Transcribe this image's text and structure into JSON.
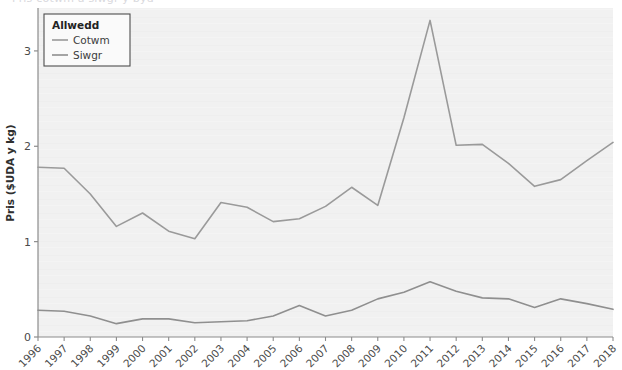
{
  "figure": {
    "width": 622,
    "height": 370,
    "plot_bg": "#f1f1f1",
    "page_bg": "#ffffff",
    "axis_color": "#8c8c8c",
    "cropped_title_text": "Pris cotwm a siwgr y byd"
  },
  "legend": {
    "title": "Allwedd",
    "position": "top-left-inside",
    "border_color": "#4d4d4d",
    "background": "#fafafa",
    "entries": [
      {
        "label": "Cotwm",
        "color": "#9a9a9a"
      },
      {
        "label": "Siwgr",
        "color": "#8f8f8f"
      }
    ]
  },
  "chart_data": {
    "type": "line",
    "title": "",
    "xlabel": "",
    "ylabel": "Pris ($UDA y kg)",
    "xlim": [
      1996,
      2018
    ],
    "ylim": [
      0,
      3.45
    ],
    "yticks": [
      0,
      1,
      2,
      3
    ],
    "ytick_labels": [
      "0",
      "1",
      "2",
      "3"
    ],
    "grid": false,
    "legend_position": "upper left",
    "x": [
      1996,
      1997,
      1998,
      1999,
      2000,
      2001,
      2002,
      2003,
      2004,
      2005,
      2006,
      2007,
      2008,
      2009,
      2010,
      2011,
      2012,
      2013,
      2014,
      2015,
      2016,
      2017,
      2018
    ],
    "xtick_labels": [
      "1996",
      "1997",
      "1998",
      "1999",
      "2000",
      "2001",
      "2002",
      "2003",
      "2004",
      "2005",
      "2006",
      "2007",
      "2008",
      "2009",
      "2010",
      "2011",
      "2012",
      "2013",
      "2014",
      "2015",
      "2016",
      "2017",
      "2018"
    ],
    "series": [
      {
        "name": "Cotwm",
        "color": "#9a9a9a",
        "values": [
          1.78,
          1.77,
          1.5,
          1.16,
          1.3,
          1.11,
          1.03,
          1.41,
          1.36,
          1.21,
          1.24,
          1.37,
          1.57,
          1.38,
          2.3,
          3.32,
          2.01,
          2.02,
          1.82,
          1.58,
          1.65,
          1.85,
          2.04
        ]
      },
      {
        "name": "Siwgr",
        "color": "#8f8f8f",
        "values": [
          0.28,
          0.27,
          0.22,
          0.14,
          0.19,
          0.19,
          0.15,
          0.16,
          0.17,
          0.22,
          0.33,
          0.22,
          0.28,
          0.4,
          0.47,
          0.58,
          0.48,
          0.41,
          0.4,
          0.31,
          0.4,
          0.35,
          0.29
        ]
      }
    ]
  }
}
